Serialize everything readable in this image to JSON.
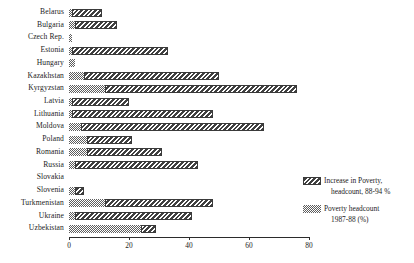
{
  "chart_data": {
    "type": "bar",
    "orientation": "horizontal",
    "stacked": true,
    "title": "",
    "xlabel": "",
    "ylabel": "",
    "xlim": [
      0,
      80
    ],
    "xticks": [
      0,
      20,
      40,
      60,
      80
    ],
    "xtick_labels": [
      "0",
      "20",
      "40",
      "60",
      "80"
    ],
    "grid": false,
    "legend_position": "right",
    "categories": [
      "Belarus",
      "Bulgaria",
      "Czech Rep.",
      "Estonia",
      "Hungary",
      "Kazakhstan",
      "Kyrgyzstan",
      "Latvia",
      "Lithuania",
      "Moldova",
      "Poland",
      "Romania",
      "Russia",
      "Slovakia",
      "Slovenia",
      "Turkmenistan",
      "Ukraine",
      "Uzbekistan"
    ],
    "series": [
      {
        "name": "Poverty headcount 1987-88 (%)",
        "key": "base",
        "pattern": "stipple",
        "color": "#5e5e5e",
        "values": [
          1,
          2,
          1,
          1,
          2,
          5,
          12,
          1,
          1,
          4,
          6,
          6,
          2,
          0,
          2,
          12,
          2,
          24
        ]
      },
      {
        "name": "Increase in Poverty, headcount, 88-94 %",
        "key": "increase",
        "pattern": "hatch",
        "color": "#404040",
        "values": [
          10,
          14,
          0,
          32,
          0,
          45,
          64,
          19,
          47,
          61,
          15,
          25,
          41,
          0,
          3,
          36,
          39,
          5
        ]
      }
    ],
    "totals": [
      11,
      16,
      1,
      33,
      2,
      50,
      76,
      20,
      48,
      65,
      21,
      31,
      43,
      0,
      5,
      48,
      41,
      29
    ]
  },
  "legend": {
    "entries": [
      {
        "line1": "Increase in Poverty,",
        "line2": "headcount, 88-94 %",
        "swatch": "hatch-swatch"
      },
      {
        "line1": "Poverty headcount",
        "line2": "1987-88 (%)",
        "swatch": "stipple-swatch"
      }
    ]
  }
}
